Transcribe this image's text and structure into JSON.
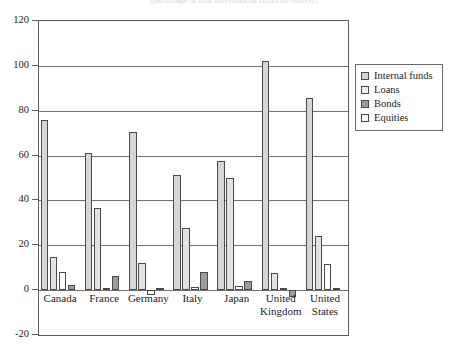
{
  "top_clipped_text": "(percentage of total non-financial corporate sources)",
  "chart_data": {
    "type": "bar",
    "title": "",
    "subtitle": "",
    "xlabel": "",
    "ylabel": "",
    "ylim": [
      -20,
      120
    ],
    "yticks": [
      -20,
      0,
      20,
      40,
      60,
      80,
      100,
      120
    ],
    "ytick_labels": [
      "-20",
      "0",
      "20",
      "40",
      "60",
      "80",
      "100",
      "120"
    ],
    "grid": "horizontal",
    "legend_position": "right",
    "categories": [
      "Canada",
      "France",
      "Germany",
      "Italy",
      "Japan",
      "United\nKingdom",
      "United\nStates"
    ],
    "series": [
      {
        "name": "Internal funds",
        "color": "#d4d4d4",
        "values": [
          76.0,
          61.0,
          70.5,
          51.5,
          57.5,
          102.0,
          85.5
        ]
      },
      {
        "name": "Loans",
        "color": "#e4e4e4",
        "values": [
          15.0,
          36.5,
          12.0,
          27.5,
          50.0,
          7.5,
          24.0
        ]
      },
      {
        "name": "Bonds",
        "color": "#9a9a9a",
        "values": [
          8.0,
          1.0,
          -2.0,
          1.5,
          2.0,
          1.0,
          11.5
        ]
      },
      {
        "name": "Equities",
        "color": "#ffffff",
        "values": [
          2.5,
          6.5,
          1.0,
          8.0,
          4.0,
          -3.0,
          1.0
        ]
      }
    ],
    "note": "Bonds series is drawn white-filled for Canada/Germany/Italy/Japan/UK/US-bonds bar rendering; Equities drawn dark-gray for France/Italy/Japan/UK/US per legend ordering in source figure"
  },
  "legend": {
    "items": [
      {
        "label": "Internal funds",
        "swatch": "#d4d4d4"
      },
      {
        "label": "Loans",
        "swatch": "#ededed"
      },
      {
        "label": "Bonds",
        "swatch": "#9a9a9a"
      },
      {
        "label": "Equities",
        "swatch": "#ffffff"
      }
    ]
  },
  "render": {
    "bars": [
      {
        "group": 0,
        "series": 0,
        "value": 76.0,
        "fill": "#d6d6d6"
      },
      {
        "group": 0,
        "series": 1,
        "value": 15.0,
        "fill": "#e2e2e2"
      },
      {
        "group": 0,
        "series": 2,
        "value": 8.0,
        "fill": "#ffffff"
      },
      {
        "group": 0,
        "series": 3,
        "value": 2.5,
        "fill": "#9e9e9e"
      },
      {
        "group": 1,
        "series": 0,
        "value": 61.0,
        "fill": "#d6d6d6"
      },
      {
        "group": 1,
        "series": 1,
        "value": 36.5,
        "fill": "#e2e2e2"
      },
      {
        "group": 1,
        "series": 2,
        "value": 1.0,
        "fill": "#ffffff"
      },
      {
        "group": 1,
        "series": 3,
        "value": 6.5,
        "fill": "#9e9e9e"
      },
      {
        "group": 2,
        "series": 0,
        "value": 70.5,
        "fill": "#d6d6d6"
      },
      {
        "group": 2,
        "series": 1,
        "value": 12.0,
        "fill": "#e2e2e2"
      },
      {
        "group": 2,
        "series": 2,
        "value": -2.0,
        "fill": "#ffffff"
      },
      {
        "group": 2,
        "series": 3,
        "value": 1.0,
        "fill": "#9e9e9e"
      },
      {
        "group": 3,
        "series": 0,
        "value": 51.5,
        "fill": "#d6d6d6"
      },
      {
        "group": 3,
        "series": 1,
        "value": 27.5,
        "fill": "#e2e2e2"
      },
      {
        "group": 3,
        "series": 2,
        "value": 1.5,
        "fill": "#ffffff"
      },
      {
        "group": 3,
        "series": 3,
        "value": 8.0,
        "fill": "#9e9e9e"
      },
      {
        "group": 4,
        "series": 0,
        "value": 57.5,
        "fill": "#d6d6d6"
      },
      {
        "group": 4,
        "series": 1,
        "value": 50.0,
        "fill": "#e2e2e2"
      },
      {
        "group": 4,
        "series": 2,
        "value": 2.0,
        "fill": "#ffffff"
      },
      {
        "group": 4,
        "series": 3,
        "value": 4.0,
        "fill": "#9e9e9e"
      },
      {
        "group": 5,
        "series": 0,
        "value": 102.0,
        "fill": "#d6d6d6"
      },
      {
        "group": 5,
        "series": 1,
        "value": 7.5,
        "fill": "#e2e2e2"
      },
      {
        "group": 5,
        "series": 2,
        "value": 1.0,
        "fill": "#ffffff"
      },
      {
        "group": 5,
        "series": 3,
        "value": -3.0,
        "fill": "#9e9e9e"
      },
      {
        "group": 6,
        "series": 0,
        "value": 85.5,
        "fill": "#d6d6d6"
      },
      {
        "group": 6,
        "series": 1,
        "value": 24.0,
        "fill": "#e2e2e2"
      },
      {
        "group": 6,
        "series": 2,
        "value": 11.5,
        "fill": "#ffffff"
      },
      {
        "group": 6,
        "series": 3,
        "value": 1.0,
        "fill": "#9e9e9e"
      }
    ]
  }
}
